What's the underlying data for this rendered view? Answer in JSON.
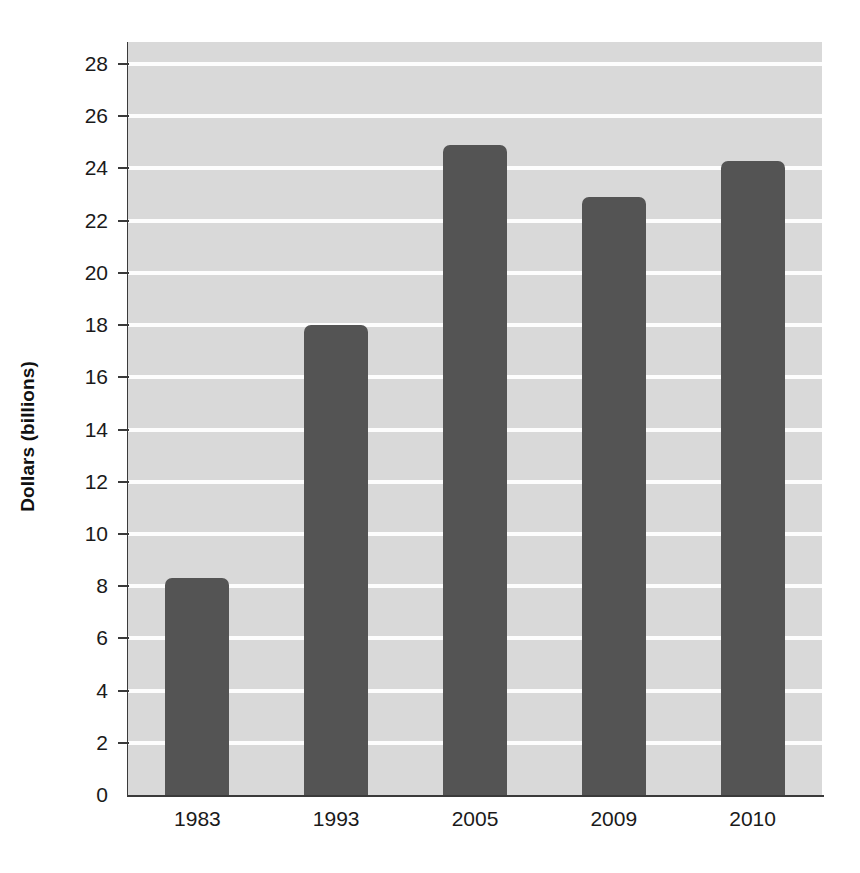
{
  "chart_data": {
    "type": "bar",
    "title": "",
    "xlabel": "",
    "ylabel": "Dollars (billions)",
    "categories": [
      "1983",
      "1993",
      "2005",
      "2009",
      "2010"
    ],
    "values": [
      8.3,
      18.0,
      24.9,
      22.9,
      24.3
    ],
    "series": [
      {
        "name": "Dollars (billions)",
        "values": [
          8.3,
          18.0,
          24.9,
          22.9,
          24.3
        ]
      }
    ],
    "ylim": [
      0,
      28
    ],
    "ytick_step": 2,
    "yticks": [
      0,
      2,
      4,
      6,
      8,
      10,
      12,
      14,
      16,
      18,
      20,
      22,
      24,
      26,
      28
    ],
    "ytick_labels": [
      "0",
      "2",
      "4",
      "6",
      "8",
      "10",
      "12",
      "14",
      "16",
      "18",
      "20",
      "22",
      "24",
      "26",
      "28"
    ],
    "grid": true,
    "grid_axis": "y",
    "grid_color": "#fdfdfd",
    "legend": false,
    "legend_position": "none",
    "bar_color": "#545454",
    "plot_background": "#d9d9d9",
    "page_background": "#ffffff",
    "axis_color": "#3a3a3a",
    "annotations": []
  }
}
